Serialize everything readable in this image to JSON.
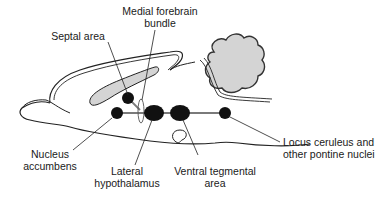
{
  "diagram": {
    "type": "sagittal brain section - reward pathway",
    "colors": {
      "outline": "#222222",
      "fill_gray": "#d4d4d4",
      "nucleus": "#111111",
      "pathway": "#7a7a7a",
      "background": "#ffffff"
    },
    "labels": {
      "medial_forebrain_bundle": {
        "line1": "Medial forebrain",
        "line2": "bundle"
      },
      "septal_area": {
        "line1": "Septal area"
      },
      "nucleus_accumbens": {
        "line1": "Nucleus",
        "line2": "accumbens"
      },
      "lateral_hypothalamus": {
        "line1": "Lateral",
        "line2": "hypothalamus"
      },
      "ventral_tegmental_area": {
        "line1": "Ventral tegmental",
        "line2": "area"
      },
      "locus_ceruleus": {
        "line1": "Locus ceruleus and",
        "line2": "other pontine nuclei"
      }
    },
    "structures": [
      "septal-area-nucleus",
      "nucleus-accumbens",
      "lateral-hypothalamus",
      "ventral-tegmental-area",
      "locus-ceruleus",
      "cerebellum",
      "corpus-callosum",
      "medial-forebrain-bundle-pathway"
    ]
  }
}
